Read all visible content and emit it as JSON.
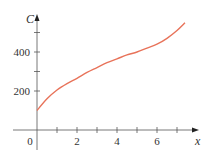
{
  "chart_data": {
    "type": "line",
    "title": "",
    "xlabel": "x",
    "ylabel": "C",
    "xlim": [
      -1.2,
      8.1
    ],
    "ylim": [
      -100,
      560
    ],
    "x_ticks": [
      1,
      2,
      3,
      4,
      5,
      6,
      7
    ],
    "x_tick_labels": [
      "0",
      "2",
      "4",
      "6"
    ],
    "x_tick_label_positions": [
      0,
      2,
      4,
      6
    ],
    "y_ticks": [
      200,
      300,
      400,
      500
    ],
    "y_tick_labels": [
      "200",
      "400"
    ],
    "y_tick_label_positions": [
      200,
      400
    ],
    "grid": false,
    "legend": null,
    "series": [
      {
        "name": "C(x)",
        "color": "#e8735a",
        "x": [
          0,
          0.5,
          1,
          1.5,
          2,
          2.5,
          3,
          3.5,
          4,
          4.5,
          5,
          5.5,
          6,
          6.5,
          7,
          7.4
        ],
        "values": [
          100,
          160,
          205,
          238,
          265,
          295,
          320,
          345,
          365,
          385,
          400,
          420,
          440,
          470,
          510,
          550
        ]
      }
    ]
  },
  "colors": {
    "axis": "#555555",
    "curve": "#e8735a"
  }
}
